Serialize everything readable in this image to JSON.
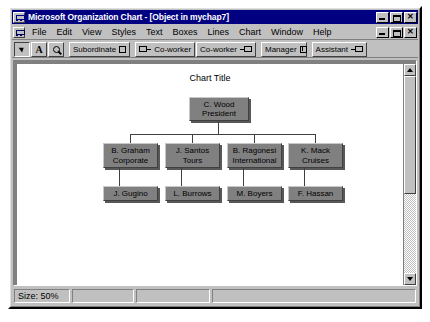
{
  "window": {
    "title": "Microsoft Organization Chart - [Object in mychap7]",
    "icon": "orgchart-icon",
    "controls": {
      "minimize": "minimize",
      "restore": "restore",
      "close": "close"
    }
  },
  "menubar": {
    "doc_icon": "document-icon",
    "items": [
      {
        "label": "File"
      },
      {
        "label": "Edit"
      },
      {
        "label": "View"
      },
      {
        "label": "Styles"
      },
      {
        "label": "Text"
      },
      {
        "label": "Boxes"
      },
      {
        "label": "Lines"
      },
      {
        "label": "Chart"
      },
      {
        "label": "Window"
      },
      {
        "label": "Help"
      }
    ],
    "controls": {
      "minimize": "minimize",
      "restore": "restore",
      "close": "close"
    }
  },
  "toolbar": {
    "select_tool": "arrow-pointer-icon",
    "text_tool": "A",
    "zoom_tool": "magnifier-icon",
    "buttons": [
      {
        "label": "Subordinate",
        "icon": "subordinate-icon"
      },
      {
        "label": "Co-worker",
        "icon": "coworker-left-icon"
      },
      {
        "label": "Co-worker",
        "icon": "coworker-right-icon"
      },
      {
        "label": "Manager",
        "icon": "manager-icon"
      },
      {
        "label": "Assistant",
        "icon": "assistant-icon"
      }
    ]
  },
  "chart": {
    "title": "Chart Title",
    "root": {
      "line1": "C. Wood",
      "line2": "President"
    },
    "managers": [
      {
        "line1": "B. Graham",
        "line2": "Corporate"
      },
      {
        "line1": "J. Santos",
        "line2": "Tours"
      },
      {
        "line1": "B. Ragonesi",
        "line2": "International"
      },
      {
        "line1": "K. Mack",
        "line2": "Cruises"
      }
    ],
    "staff": [
      {
        "line1": "J. Gugino"
      },
      {
        "line1": "L. Burrows"
      },
      {
        "line1": "M. Boyers"
      },
      {
        "line1": "F. Hassan"
      }
    ]
  },
  "statusbar": {
    "size": "Size: 50%",
    "panel2": "",
    "panel3": "",
    "panel4": ""
  },
  "colors": {
    "titlebar": "#000080",
    "chrome": "#c0c0c0",
    "node_fill": "#808080",
    "mdi_background": "#808080"
  }
}
